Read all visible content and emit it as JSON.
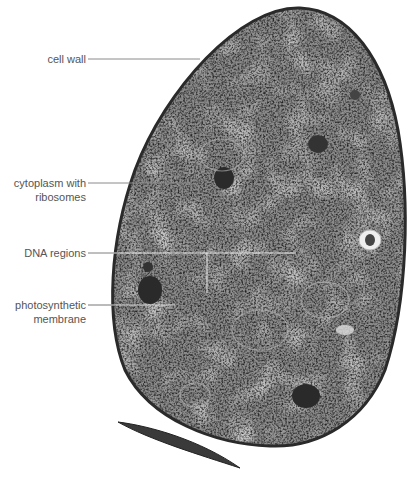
{
  "figure": {
    "labels": [
      {
        "id": "cell-wall",
        "lines": [
          "cell wall"
        ]
      },
      {
        "id": "cytoplasm",
        "lines": [
          "cytoplasm with",
          "ribosomes"
        ]
      },
      {
        "id": "dna",
        "lines": [
          "DNA regions"
        ]
      },
      {
        "id": "photosynthetic",
        "lines": [
          "photosynthetic",
          "membrane"
        ]
      }
    ],
    "colors": {
      "label_text": "#555555",
      "leader_line": "#888888",
      "cell_edge": "#2a2a2a",
      "cell_fill": "#7a7a7a",
      "background": "#ffffff"
    }
  }
}
